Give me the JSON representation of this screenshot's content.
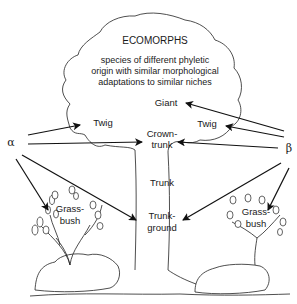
{
  "title": "ECOMORPHS",
  "description": [
    "species of different phyletic",
    "origin with similar morphological",
    "adaptations to similar niches"
  ],
  "niches": {
    "giant": "Giant",
    "twig_left": "Twig",
    "twig_right": "Twig",
    "crown_trunk": [
      "Crown-",
      "trunk"
    ],
    "trunk": "Trunk",
    "trunk_ground": [
      "Trunk-",
      "ground"
    ],
    "grass_bush_left": [
      "Grass-",
      "bush"
    ],
    "grass_bush_right": [
      "Grass-",
      "bush"
    ]
  },
  "species": {
    "alpha": "α",
    "beta": "β"
  },
  "arrows": {
    "alpha": [
      "Twig",
      "Crown-trunk",
      "Grass-bush",
      "Trunk-ground"
    ],
    "beta": [
      "Giant",
      "Twig",
      "Crown-trunk",
      "Trunk-ground",
      "Grass-bush"
    ]
  }
}
